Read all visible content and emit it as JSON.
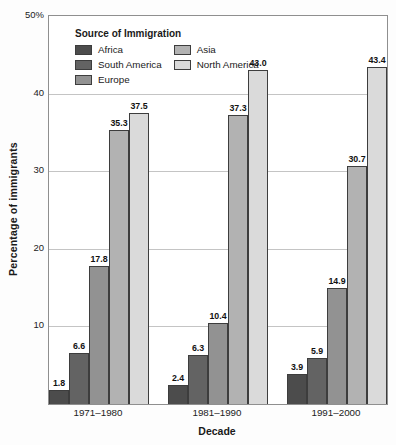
{
  "chart_data": {
    "type": "bar",
    "title": "",
    "legend_title": "Source of Immigration",
    "xlabel": "Decade",
    "ylabel": "Percentage of immigrants",
    "ylim": [
      0,
      50
    ],
    "grid": true,
    "legend_position": "top-left-inside",
    "yticks": [
      {
        "value": 50,
        "label": "50%"
      },
      {
        "value": 40,
        "label": "40"
      },
      {
        "value": 30,
        "label": "30"
      },
      {
        "value": 20,
        "label": "20"
      },
      {
        "value": 10,
        "label": "10"
      }
    ],
    "categories": [
      "1971–1980",
      "1981–1990",
      "1991–2000"
    ],
    "series": [
      {
        "name": "Africa",
        "color": "#4c4c4c",
        "values": [
          1.8,
          2.4,
          3.9
        ]
      },
      {
        "name": "South America",
        "color": "#636363",
        "values": [
          6.6,
          6.3,
          5.9
        ]
      },
      {
        "name": "Europe",
        "color": "#929292",
        "values": [
          17.8,
          10.4,
          14.9
        ]
      },
      {
        "name": "Asia",
        "color": "#b2b2b2",
        "values": [
          35.3,
          37.3,
          30.7
        ]
      },
      {
        "name": "North America",
        "color": "#dadada",
        "values": [
          37.5,
          43.0,
          43.4
        ]
      }
    ],
    "legend_columns": [
      [
        0,
        1,
        2
      ],
      [
        3,
        4
      ]
    ],
    "colors": {
      "grid": "#c4c4c4",
      "plot_border": "#8f8f8f",
      "bar_border": "#3d3d3d",
      "text": "#1a1a1a"
    }
  }
}
